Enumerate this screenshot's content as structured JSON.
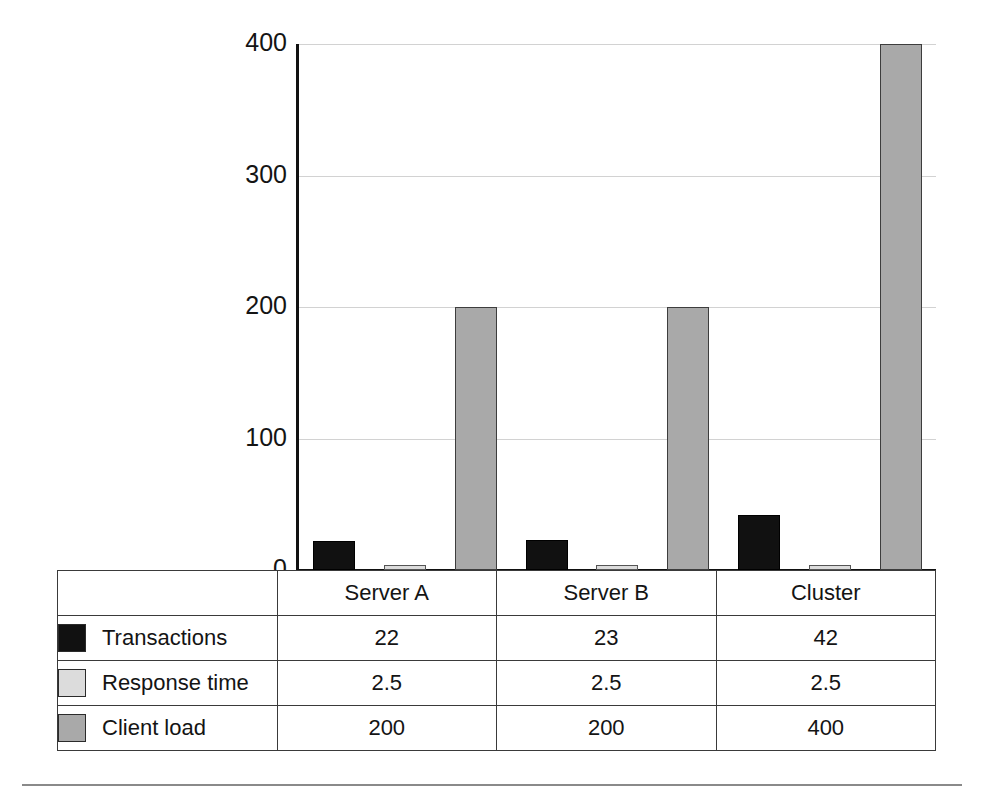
{
  "chart_data": {
    "type": "bar",
    "title": "",
    "subtitle": "",
    "xlabel": "",
    "ylabel": "",
    "categories": [
      "Server A",
      "Server B",
      "Cluster"
    ],
    "series": [
      {
        "name": "Transactions",
        "values": [
          22,
          23,
          42
        ],
        "color": "#111111"
      },
      {
        "name": "Response time",
        "values": [
          2.5,
          2.5,
          2.5
        ],
        "color": "#dcdcdc"
      },
      {
        "name": "Client load",
        "values": [
          200,
          200,
          400
        ],
        "color": "#a9a9a9"
      }
    ],
    "ylim": [
      0,
      400
    ],
    "yticks": [
      "0",
      "100",
      "200",
      "300",
      "400"
    ],
    "ytick_values": [
      0,
      100,
      200,
      300,
      400
    ],
    "grid": true,
    "legend_position": "data-table",
    "annotations": []
  },
  "axis": {
    "ticks": [
      {
        "label": "400",
        "value": 400
      },
      {
        "label": "300",
        "value": 300
      },
      {
        "label": "200",
        "value": 200
      },
      {
        "label": "100",
        "value": 100
      },
      {
        "label": "0",
        "value": 0
      }
    ]
  },
  "table": {
    "column_headers": [
      "",
      "Server A",
      "Server B",
      "Cluster"
    ],
    "rows": [
      {
        "legend_label": "Transactions",
        "swatch": "black-square-swatch",
        "cells": [
          "22",
          "23",
          "42"
        ]
      },
      {
        "legend_label": "Response time",
        "swatch": "light-gray-square-swatch",
        "cells": [
          "2.5",
          "2.5",
          "2.5"
        ]
      },
      {
        "legend_label": "Client load",
        "swatch": "medium-gray-square-swatch",
        "cells": [
          "200",
          "200",
          "400"
        ]
      }
    ]
  },
  "colors": {
    "series_transactions": "#111111",
    "series_response_time": "#dcdcdc",
    "series_client_load": "#a9a9a9",
    "gridline": "#d2d2d2",
    "axis": "#111111",
    "border": "#3a3a3a",
    "background": "#ffffff"
  }
}
